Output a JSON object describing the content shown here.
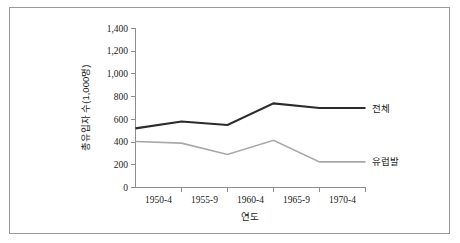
{
  "chart_data": {
    "type": "line",
    "title": "",
    "xlabel": "연도",
    "ylabel": "총유입자 수(1,000명)",
    "categories": [
      "1950-4",
      "1955-9",
      "1960-4",
      "1965-9",
      "1970-4"
    ],
    "series": [
      {
        "name": "전체",
        "color": "#2b2b2b",
        "values": [
          520,
          580,
          550,
          740,
          700
        ]
      },
      {
        "name": "유럽발",
        "color": "#a8a8a8",
        "values": [
          405,
          390,
          290,
          415,
          225
        ]
      }
    ],
    "ylim": [
      0,
      1400
    ],
    "ytick_labels": [
      "0",
      "200",
      "400",
      "600",
      "800",
      "1,000",
      "1,200",
      "1,400"
    ],
    "ytick_values": [
      0,
      200,
      400,
      600,
      800,
      1000,
      1200,
      1400
    ],
    "grid": false,
    "legend": "inline-right-of-series"
  },
  "axis": {
    "axis_color": "#8d8d8d",
    "frame_color": "#9a9a9a",
    "background": "#ffffff"
  }
}
